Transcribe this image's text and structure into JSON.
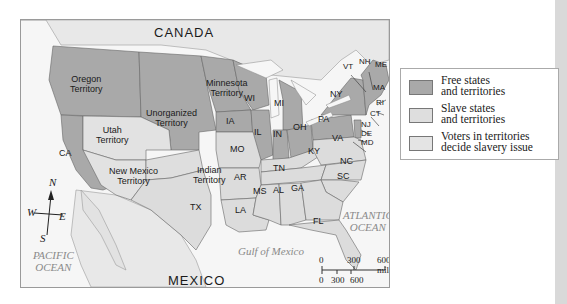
{
  "map": {
    "countries": {
      "canada": "CANADA",
      "mexico": "MEXICO"
    },
    "water_bodies": {
      "pacific": "PACIFIC\nOCEAN",
      "atlantic": "ATLANTIC\nOCEAN",
      "gulf": "Gulf of Mexico"
    },
    "territories": {
      "oregon": "Oregon\nTerritory",
      "unorganized": "Unorganized\nTerritory",
      "minnesota": "Minnesota\nTerritory",
      "utah": "Utah\nTerritory",
      "new_mexico": "New Mexico\nTerritory",
      "indian": "Indian\nTerritory"
    },
    "states": {
      "CA": "CA",
      "TX": "TX",
      "WI": "WI",
      "MI": "MI",
      "IA": "IA",
      "IL": "IL",
      "IN": "IN",
      "OH": "OH",
      "PA": "PA",
      "NY": "NY",
      "VT": "VT",
      "NH": "NH",
      "ME": "ME",
      "MA": "MA",
      "RI": "RI",
      "CT": "CT",
      "NJ": "NJ",
      "DE": "DE",
      "MD": "MD",
      "VA": "VA",
      "KY": "KY",
      "MO": "MO",
      "TN": "TN",
      "NC": "NC",
      "SC": "SC",
      "AR": "AR",
      "MS": "MS",
      "AL": "AL",
      "GA": "GA",
      "LA": "LA",
      "FL": "FL"
    },
    "compass": {
      "n": "N",
      "s": "S",
      "e": "E",
      "w": "W"
    },
    "scale_bar": {
      "miles_ticks": [
        "0",
        "300",
        "600 miles"
      ],
      "km_ticks": [
        "0",
        "300",
        "600 kilometers"
      ]
    },
    "colors": {
      "free": "#a9a9a9",
      "slave": "#dcdcdc",
      "popular_sovereignty": "#e2e2e2",
      "land_foreign": "#ececec",
      "water": "#f5f5f5"
    }
  },
  "legend": {
    "items": [
      {
        "label": "Free states\nand territories",
        "color": "#a9a9a9"
      },
      {
        "label": "Slave states\nand territories",
        "color": "#dedede"
      },
      {
        "label": "Voters in territories\ndecide slavery issue",
        "color": "#e4e4e4"
      }
    ]
  }
}
